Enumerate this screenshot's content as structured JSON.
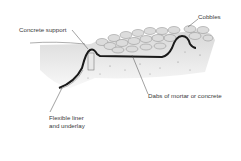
{
  "diagram": {
    "labels": {
      "cobbles": "Cobbles",
      "concrete_support": "Concrete support",
      "dabs": "Dabs of mortar or concrete",
      "liner_line1": "Flexible liner",
      "liner_line2": "and underlay"
    },
    "colors": {
      "liner": "#1a1a1a",
      "soil": "#c8c8c8",
      "stone": "#d6d6d6",
      "text": "#3a3a3a"
    }
  }
}
